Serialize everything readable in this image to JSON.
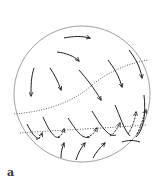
{
  "figure": {
    "panel_label": "a",
    "colors": {
      "outline": "#888888",
      "arrows": "#222222",
      "dotted": "#333333",
      "background": "#ffffff"
    }
  }
}
